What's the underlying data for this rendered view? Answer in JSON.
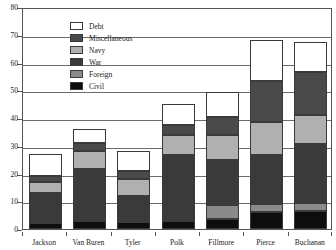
{
  "chart_data": {
    "type": "bar",
    "stacked": true,
    "title": "",
    "subtitle": "",
    "xlabel": "",
    "ylabel": "",
    "ylim": [
      0,
      80
    ],
    "ytick_labels": [
      "0",
      "10",
      "20",
      "30",
      "40",
      "50",
      "60",
      "70",
      "80"
    ],
    "ytick_values": [
      0,
      10,
      20,
      30,
      40,
      50,
      60,
      70,
      80
    ],
    "grid": true,
    "grid_axis": "y",
    "legend_position": "top-left-inside",
    "categories": [
      "Jackson",
      "Van Buren",
      "Tyler",
      "Polk",
      "Fillmore",
      "Pierce",
      "Buchanan"
    ],
    "series": [
      {
        "name": "Civil",
        "color": "#0d0d0d",
        "values": [
          2.0,
          3.0,
          2.5,
          3.0,
          3.5,
          6.0,
          6.5
        ]
      },
      {
        "name": "Foreign",
        "color": "#8a8a8a",
        "values": [
          0.0,
          0.0,
          0.0,
          0.0,
          5.0,
          3.0,
          3.0
        ]
      },
      {
        "name": "War",
        "color": "#3a3a3a",
        "values": [
          11.0,
          18.5,
          9.5,
          23.5,
          16.5,
          17.5,
          21.0
        ]
      },
      {
        "name": "Navy",
        "color": "#b0b0b0",
        "values": [
          4.0,
          6.5,
          6.0,
          7.5,
          9.0,
          12.0,
          10.5
        ]
      },
      {
        "name": "Miscellaneous",
        "color": "#4a4a4a",
        "values": [
          2.0,
          3.0,
          3.0,
          3.5,
          6.5,
          15.0,
          15.5
        ]
      },
      {
        "name": "Debt",
        "color": "#ffffff",
        "values": [
          8.0,
          5.0,
          7.0,
          7.5,
          9.0,
          14.5,
          11.0
        ]
      }
    ],
    "totals": [
      27.0,
      36.0,
      28.0,
      45.0,
      49.5,
      68.0,
      67.5
    ],
    "legend_order": [
      "Debt",
      "Miscellaneous",
      "Navy",
      "War",
      "Foreign",
      "Civil"
    ]
  }
}
